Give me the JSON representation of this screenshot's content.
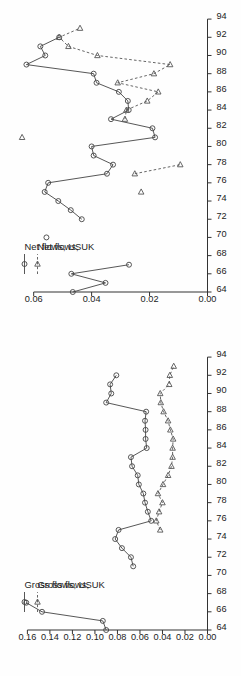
{
  "figure": {
    "background_color": "#ffffff",
    "line_color": "#444444",
    "dashed_color": "#555555",
    "axis_color": "#333333",
    "orientation": "rotated-90-ccw"
  },
  "chart_data": [
    {
      "id": "net-flows",
      "type": "line",
      "title": "",
      "xlabel": "",
      "ylabel": "",
      "xlim": [
        64,
        95
      ],
      "ylim": [
        0.0,
        0.068
      ],
      "xticks": [
        64,
        66,
        68,
        70,
        72,
        74,
        76,
        78,
        80,
        82,
        84,
        86,
        88,
        90,
        92,
        94
      ],
      "xtick_labels": [
        "64",
        "66",
        "68",
        "70",
        "72",
        "74",
        "76",
        "78",
        "80",
        "82",
        "84",
        "86",
        "88",
        "90",
        "92",
        "94"
      ],
      "yticks": [
        0.0,
        0.02,
        0.04,
        0.06
      ],
      "ytick_labels": [
        "0.00",
        "0.02",
        "0.04",
        "0.06"
      ],
      "grid": false,
      "legend_position": "upper-left",
      "x": [
        64,
        65,
        66,
        67,
        68,
        69,
        70,
        71,
        72,
        73,
        74,
        75,
        76,
        77,
        78,
        79,
        80,
        81,
        82,
        83,
        84,
        85,
        86,
        87,
        88,
        89,
        90,
        91,
        92,
        93,
        94
      ],
      "series": [
        {
          "name": "Net flows, US",
          "marker": "circle",
          "line_style": "solid",
          "values": [
            0.0465,
            0.0352,
            0.047,
            0.0271,
            null,
            null,
            0.0556,
            null,
            0.0434,
            0.0472,
            0.0515,
            0.0562,
            0.055,
            0.0347,
            0.0326,
            0.0393,
            0.04,
            0.0181,
            0.019,
            0.0333,
            0.0272,
            0.0275,
            0.0306,
            0.0383,
            0.0393,
            0.0625,
            0.056,
            0.0577,
            0.0512,
            null,
            null
          ]
        },
        {
          "name": "Net flows, UK",
          "marker": "triangle",
          "line_style": "dashed",
          "values": [
            null,
            null,
            null,
            null,
            null,
            null,
            null,
            null,
            null,
            null,
            null,
            0.0229,
            null,
            0.0251,
            0.0094,
            null,
            null,
            0.064,
            null,
            0.0285,
            0.028,
            0.0208,
            0.017,
            0.031,
            0.0185,
            0.0129,
            0.038,
            0.048,
            0.0512,
            0.044,
            null
          ]
        }
      ]
    },
    {
      "id": "gross-flows",
      "type": "line",
      "title": "",
      "xlabel": "",
      "ylabel": "",
      "xlim": [
        64,
        95
      ],
      "ylim": [
        0.0,
        0.175
      ],
      "xticks": [
        64,
        66,
        68,
        70,
        72,
        74,
        76,
        78,
        80,
        82,
        84,
        86,
        88,
        90,
        92,
        94
      ],
      "xtick_labels": [
        "64",
        "66",
        "68",
        "70",
        "72",
        "74",
        "76",
        "78",
        "80",
        "82",
        "84",
        "86",
        "88",
        "90",
        "92",
        "94"
      ],
      "yticks": [
        0.0,
        0.02,
        0.04,
        0.06,
        0.08,
        0.1,
        0.12,
        0.14,
        0.16
      ],
      "ytick_labels": [
        "0.00",
        "0.02",
        "0.04",
        "0.06",
        "0.08",
        "0.10",
        "0.12",
        "0.14",
        "0.16"
      ],
      "grid": false,
      "legend_position": "upper-left",
      "x": [
        64,
        65,
        66,
        67,
        68,
        69,
        70,
        71,
        72,
        73,
        74,
        75,
        76,
        77,
        78,
        79,
        80,
        81,
        82,
        83,
        84,
        85,
        86,
        87,
        88,
        89,
        90,
        91,
        92,
        93,
        94
      ],
      "series": [
        {
          "name": "Gross flows, US",
          "marker": "circle",
          "line_style": "solid",
          "values": [
            0.09,
            0.093,
            0.147,
            0.161,
            null,
            null,
            null,
            0.066,
            0.068,
            0.076,
            0.082,
            0.079,
            0.05,
            0.053,
            0.0555,
            0.057,
            0.061,
            0.062,
            0.067,
            0.068,
            0.054,
            0.055,
            0.055,
            0.0555,
            0.0545,
            0.09,
            0.0855,
            0.0865,
            0.081,
            null,
            null
          ]
        },
        {
          "name": "Gross flows, UK",
          "marker": "triangle",
          "line_style": "dashed",
          "values": [
            null,
            null,
            null,
            null,
            null,
            null,
            null,
            null,
            null,
            null,
            null,
            0.042,
            0.0455,
            0.043,
            0.04,
            0.044,
            0.0395,
            0.035,
            0.032,
            0.031,
            0.031,
            0.0305,
            0.033,
            0.035,
            0.039,
            0.0415,
            0.042,
            0.034,
            0.0335,
            0.03,
            null
          ]
        }
      ]
    }
  ],
  "panels": {
    "net": {
      "legend": {
        "entries": [
          {
            "label": "Net flows, US",
            "marker": "circle",
            "line_style": "solid"
          },
          {
            "label": "Net flows, UK",
            "marker": "triangle",
            "line_style": "dashed"
          }
        ]
      }
    },
    "gross": {
      "legend": {
        "entries": [
          {
            "label": "Gross flows, US",
            "marker": "circle",
            "line_style": "solid"
          },
          {
            "label": "Gross flows, UK",
            "marker": "triangle",
            "line_style": "dashed"
          }
        ]
      }
    }
  }
}
